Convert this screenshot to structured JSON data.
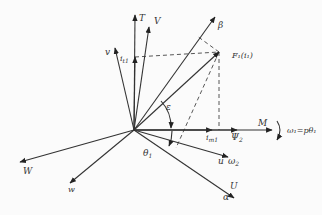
{
  "diagram": {
    "type": "vector-diagram",
    "origin": [
      134,
      130
    ],
    "colors": {
      "line": "#333333",
      "background": "#fbfbfb"
    },
    "vectors": [
      {
        "id": "T",
        "label": "T",
        "tip": [
          135,
          15
        ],
        "label_pos": [
          139,
          21
        ]
      },
      {
        "id": "V",
        "label": "V",
        "tip": [
          149,
          27
        ],
        "label_pos": [
          154,
          24
        ]
      },
      {
        "id": "v",
        "label": "v",
        "tip": [
          115,
          48
        ],
        "label_pos": [
          106,
          55
        ]
      },
      {
        "id": "beta",
        "label": "β",
        "tip": [
          215,
          17
        ],
        "label_pos": [
          217,
          27
        ]
      },
      {
        "id": "F1",
        "label": "F₁(i₁)",
        "tip": [
          219,
          52
        ],
        "label_pos": [
          232,
          58
        ]
      },
      {
        "id": "M",
        "label": "M",
        "tip": [
          272,
          130
        ],
        "label_pos": [
          259,
          126
        ]
      },
      {
        "id": "u",
        "label": "u",
        "tip": [
          228,
          157
        ],
        "label_pos": [
          219,
          164
        ]
      },
      {
        "id": "U",
        "label": "U",
        "tip": [
          234,
          198
        ],
        "label_pos": [
          230,
          189
        ]
      },
      {
        "id": "W",
        "label": "W",
        "tip": [
          20,
          162
        ],
        "label_pos": [
          24,
          174
        ]
      },
      {
        "id": "w",
        "label": "w",
        "tip": [
          70,
          183
        ],
        "label_pos": [
          69,
          191
        ]
      }
    ],
    "point_labels": {
      "it1": {
        "text": "i",
        "sub": "t1",
        "pos": [
          120,
          61
        ]
      },
      "im1": {
        "text": "i",
        "sub": "m1",
        "pos": [
          208,
          140
        ]
      },
      "psi2": {
        "text": "Ψ",
        "sub": "2",
        "pos": [
          231,
          140
        ]
      },
      "omega2": {
        "text": "ω",
        "sub": "2",
        "pos": [
          229,
          164
        ]
      },
      "alpha": {
        "text": "α",
        "pos": [
          223,
          200
        ]
      },
      "epsilon": {
        "text": "ε",
        "pos": [
          166,
          109
        ]
      },
      "theta1": {
        "text": "θ",
        "sub": "1",
        "pos": [
          144,
          156
        ]
      },
      "omega_eq": {
        "text": "ω₁=pθ₁",
        "pos": [
          280,
          132
        ]
      }
    }
  }
}
